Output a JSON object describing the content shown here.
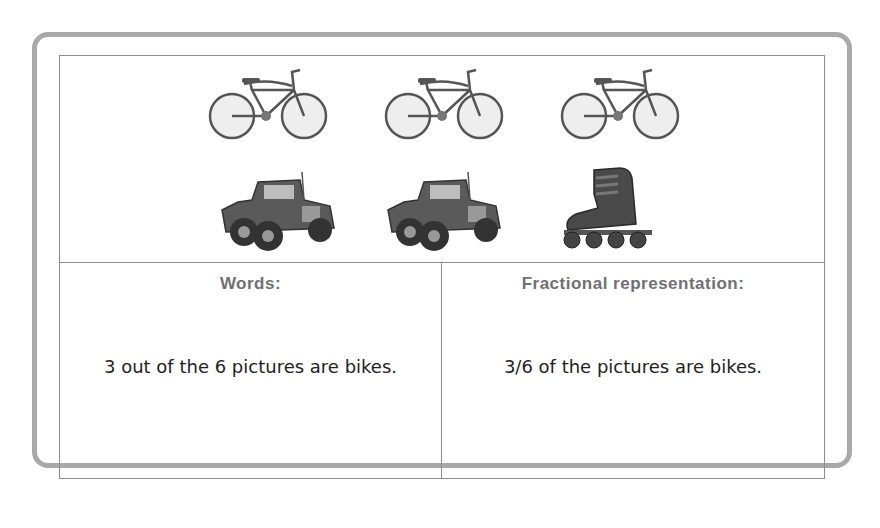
{
  "pictures": {
    "row1": [
      {
        "icon": "bicycle-icon",
        "label": "bike"
      },
      {
        "icon": "bicycle-icon",
        "label": "bike"
      },
      {
        "icon": "bicycle-icon",
        "label": "bike"
      }
    ],
    "row2": [
      {
        "icon": "jeep-icon",
        "label": "jeep"
      },
      {
        "icon": "jeep-icon",
        "label": "jeep"
      },
      {
        "icon": "inline-skate-icon",
        "label": "inline skate"
      }
    ]
  },
  "words": {
    "title": "Words:",
    "text": "3 out of the 6 pictures are bikes."
  },
  "fraction": {
    "title": "Fractional representation:",
    "text": "3/6 of the pictures are bikes."
  },
  "colors": {
    "frame_border": "#a9a9a9",
    "grid_line": "#8c8c8c",
    "title_text": "#707070",
    "body_text": "#222222"
  }
}
